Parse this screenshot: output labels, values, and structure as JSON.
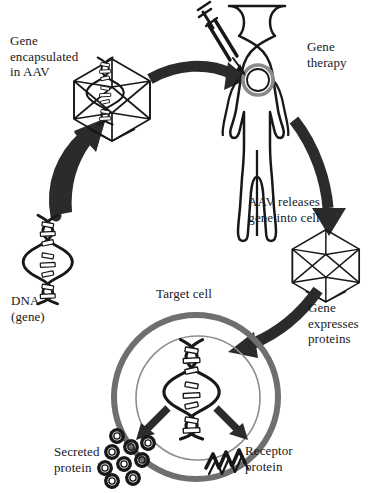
{
  "diagram": {
    "type": "process-cycle",
    "colors": {
      "ink": "#17181a",
      "arrow_fill": "#2b2b2b",
      "membrane_gray": "#6f6f6f",
      "background": "#ffffff"
    },
    "labels": {
      "gene_encapsulated": "Gene\nencapsulated\nin AAV",
      "gene_therapy": "Gene\ntherapy",
      "aav_releases": "AAV releases\ngene into cell",
      "gene_expresses": "Gene\nexpresses\nproteins",
      "dna_gene": "DNA\n(gene)",
      "target_cell": "Target cell",
      "secreted_protein": "Secreted\nprotein",
      "receptor_protein": "Receptor\nprotein"
    },
    "steps": [
      {
        "id": "dna",
        "label": "DNA\n(gene)",
        "icon": "dna-helix-icon"
      },
      {
        "id": "aav-packaged",
        "label": "Gene\nencapsulated\nin AAV",
        "icon": "aav-capsid-icon"
      },
      {
        "id": "patient",
        "label": "Gene\ntherapy",
        "icon": "human-body-syringe-icon"
      },
      {
        "id": "aav-delivery",
        "label": "AAV releases\ngene into cell",
        "icon": "aav-capsid-icon"
      },
      {
        "id": "expression",
        "label": "Gene\nexpresses\nproteins",
        "icon": "target-cell-icon"
      }
    ],
    "outputs": [
      {
        "id": "secreted-protein",
        "label": "Secreted\nprotein",
        "icon": "protein-particle-icon",
        "count": 9
      },
      {
        "id": "receptor-protein",
        "label": "Receptor\nprotein",
        "icon": "receptor-coil-icon"
      }
    ]
  }
}
